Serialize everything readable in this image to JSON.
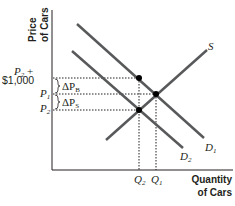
{
  "diagram": {
    "type": "supply-demand",
    "y_axis": {
      "title_line1": "Price",
      "title_line2": "of Cars"
    },
    "x_axis": {
      "title_line1": "Quantity",
      "title_line2": "of Cars"
    },
    "curves": {
      "supply": {
        "label": "S"
      },
      "demand1": {
        "label": "D",
        "sub": "1"
      },
      "demand2": {
        "label": "D",
        "sub": "2"
      }
    },
    "price_labels": {
      "p2_plus": {
        "line1_var": "P",
        "line1_sub": "2",
        "line1_suffix": " +",
        "line2": "$1,000"
      },
      "p1": {
        "var": "P",
        "sub": "1"
      },
      "p2": {
        "var": "P",
        "sub": "2"
      }
    },
    "delta_labels": {
      "buyers": {
        "prefix": "ΔP",
        "sub": "B"
      },
      "sellers": {
        "prefix": "ΔP",
        "sub": "S"
      }
    },
    "quantity_labels": {
      "q2": {
        "var": "Q",
        "sub": "2"
      },
      "q1": {
        "var": "Q",
        "sub": "1"
      }
    },
    "colors": {
      "curve": "#58595b",
      "axis": "#231f20",
      "guide": "#231f20"
    }
  }
}
